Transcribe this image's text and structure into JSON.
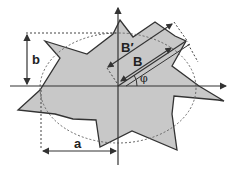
{
  "diagram": {
    "title": "",
    "labels": {
      "a": "a",
      "b": "b",
      "B": "B",
      "B_prime": "B′",
      "phi": "φ"
    },
    "colors": {
      "shape_fill": "#c8c8c8",
      "shape_stroke": "#333333",
      "axis": "#333333",
      "dotted": "#555555",
      "background": "#ffffff"
    },
    "elements": [
      "irregular star-shaped polygon (gray)",
      "dashed ellipse",
      "horizontal axis with arrow",
      "vertical axis with arrow",
      "rotated rectangle band at angle phi",
      "dimension a (horizontal)",
      "dimension b (vertical)",
      "dimension B and B′ (along rotated direction)"
    ]
  }
}
